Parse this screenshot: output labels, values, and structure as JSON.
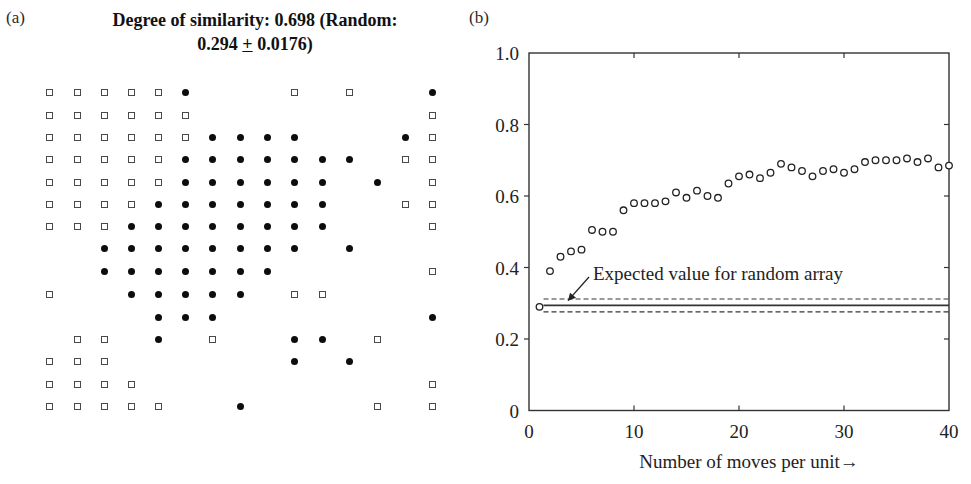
{
  "panel_a": {
    "label": "(a)",
    "title_line1": "Degree of similarity: 0.698 (Random:",
    "title_line2_pre": "0.294 ",
    "title_line2_pm": "+",
    "title_line2_post": " 0.0176)",
    "legend": {
      "square": "type A unit (open square)",
      "dot": "type B unit (filled circle)"
    },
    "grid": {
      "columns_x": [
        49,
        77,
        104,
        131,
        158,
        185,
        212,
        240,
        267,
        294,
        322,
        349,
        377,
        405,
        432
      ],
      "rows_y": [
        92,
        115,
        137,
        159,
        182,
        204,
        226,
        248,
        271,
        294,
        317,
        339,
        361,
        384,
        406
      ],
      "cells": [
        "SSSSSD...S.S..D",
        "SSSSSS........S",
        "SSSSSSDDDD...DS",
        "SSSSSDDDDDDD.SS",
        "SSSSSDDDDDD.D.S",
        "SSSSDDDDDDD..SS",
        "SSSDDDDDDDD...S",
        "..DDDDDDDD.D...",
        "..DDDDDDD.....S",
        "S..DDDDD.SS....",
        "....DDD.......D",
        ".SS.D.S..DD.S..",
        "SSS......D.D...",
        "SSSS..........S",
        "SSSSS..D....S.S"
      ]
    }
  },
  "panel_b": {
    "label": "(b)",
    "annotation": "Expected value for random array",
    "xlabel": "Number of moves per unit→"
  },
  "chart_data": {
    "type": "scatter",
    "title": "",
    "xlabel": "Number of moves per unit→",
    "ylabel": "",
    "xlim": [
      0,
      40
    ],
    "ylim": [
      0,
      1.0
    ],
    "x_ticks": [
      0,
      10,
      20,
      30,
      40
    ],
    "y_ticks": [
      0,
      0.2,
      0.4,
      0.6,
      0.8,
      1.0
    ],
    "y_tick_labels": [
      "0",
      "0.2",
      "0.4",
      "0.6",
      "0.8",
      "1.0"
    ],
    "grid": false,
    "series": [
      {
        "name": "Degree of similarity",
        "marker": "open-circle",
        "x": [
          1,
          2,
          3,
          4,
          5,
          6,
          7,
          8,
          9,
          10,
          11,
          12,
          13,
          14,
          15,
          16,
          17,
          18,
          19,
          20,
          21,
          22,
          23,
          24,
          25,
          26,
          27,
          28,
          29,
          30,
          31,
          32,
          33,
          34,
          35,
          36,
          37,
          38,
          39,
          40
        ],
        "values": [
          0.29,
          0.39,
          0.43,
          0.445,
          0.45,
          0.505,
          0.5,
          0.5,
          0.56,
          0.58,
          0.58,
          0.58,
          0.585,
          0.61,
          0.595,
          0.615,
          0.6,
          0.595,
          0.635,
          0.655,
          0.66,
          0.65,
          0.665,
          0.69,
          0.68,
          0.67,
          0.655,
          0.67,
          0.675,
          0.665,
          0.675,
          0.695,
          0.7,
          0.7,
          0.7,
          0.705,
          0.695,
          0.705,
          0.68,
          0.685
        ]
      }
    ],
    "reference_lines": [
      {
        "name": "Expected value for random array",
        "y": 0.294,
        "style": "solid",
        "x_from": 1,
        "x_to": 40
      },
      {
        "name": "upper bound",
        "y": 0.312,
        "style": "dashed",
        "x_from": 1,
        "x_to": 40
      },
      {
        "name": "lower bound",
        "y": 0.276,
        "style": "dashed",
        "x_from": 1,
        "x_to": 40
      }
    ],
    "annotations": [
      {
        "text": "Expected value for random array",
        "x": 6,
        "y": 0.37,
        "arrow_to": {
          "x": 4,
          "y": 0.296
        }
      }
    ]
  }
}
